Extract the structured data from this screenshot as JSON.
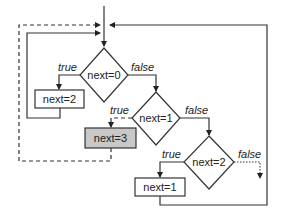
{
  "diagram": {
    "type": "flowchart",
    "decisions": [
      {
        "id": "d1",
        "label": "next=0",
        "true_label": "true",
        "false_label": "false"
      },
      {
        "id": "d2",
        "label": "next=1",
        "true_label": "true",
        "false_label": "false"
      },
      {
        "id": "d3",
        "label": "next=2",
        "true_label": "true",
        "false_label": "false"
      }
    ],
    "processes": [
      {
        "id": "p1",
        "label": "next=2",
        "highlighted": false
      },
      {
        "id": "p2",
        "label": "next=3",
        "highlighted": true
      },
      {
        "id": "p3",
        "label": "next=1",
        "highlighted": false
      }
    ],
    "colors": {
      "line": "#333333",
      "highlight_fill": "#c8c8c8",
      "background": "#ffffff"
    },
    "edges": [
      {
        "from": "entry",
        "to": "d1",
        "style": "solid"
      },
      {
        "from": "d1",
        "to": "p1",
        "label": "true",
        "style": "solid"
      },
      {
        "from": "d1",
        "to": "d2",
        "label": "false",
        "style": "solid"
      },
      {
        "from": "p1",
        "to": "entry",
        "style": "solid"
      },
      {
        "from": "d2",
        "to": "p2",
        "label": "true",
        "style": "dashed"
      },
      {
        "from": "p2",
        "to": "entry",
        "style": "dashed"
      },
      {
        "from": "d2",
        "to": "d3",
        "label": "false",
        "style": "solid"
      },
      {
        "from": "d3",
        "to": "p3",
        "label": "true",
        "style": "solid"
      },
      {
        "from": "d3",
        "to": "exit",
        "label": "false",
        "style": "dotted"
      },
      {
        "from": "p3",
        "to": "entry",
        "style": "solid"
      }
    ]
  }
}
